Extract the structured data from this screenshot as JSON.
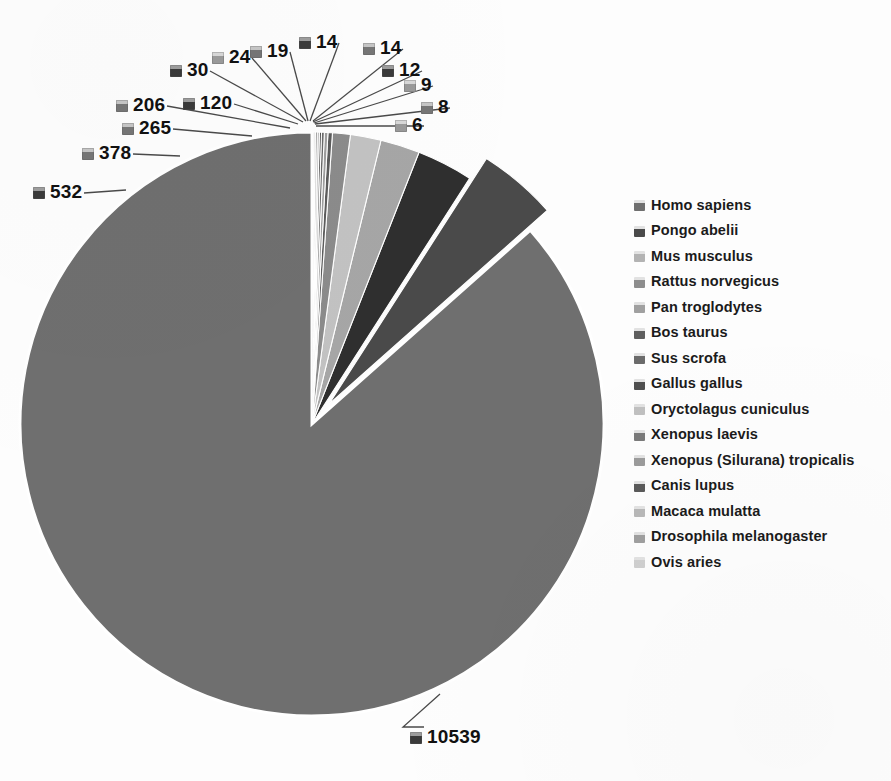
{
  "chart_data": {
    "type": "pie",
    "title": "",
    "subtitle": "",
    "xlabel": "",
    "ylabel": "",
    "legend_position": "right",
    "grid": false,
    "exploded_slices": [
      "Pongo abelii"
    ],
    "total": 12176,
    "categories": [
      "Homo sapiens",
      "Pongo abelii",
      "Mus musculus",
      "Rattus norvegicus",
      "Pan troglodytes",
      "Bos taurus",
      "Sus scrofa",
      "Gallus gallus",
      "Oryctolagus cuniculus",
      "Xenopus laevis",
      "Xenopus (Silurana) tropicalis",
      "Canis lupus",
      "Macaca mulatta",
      "Drosophila melanogaster",
      "Ovis aries"
    ],
    "values": [
      10539,
      532,
      378,
      265,
      206,
      120,
      30,
      24,
      19,
      14,
      14,
      12,
      9,
      8,
      6
    ],
    "slice_colors": [
      "#6f6f6f",
      "#4a4a4a",
      "#2f2f2f",
      "#a6a6a6",
      "#c2c2c2",
      "#8b8b8b",
      "#5c5c5c",
      "#9e9e9e",
      "#6a6a6a",
      "#3f3f3f",
      "#b0b0b0",
      "#7d7d7d",
      "#545454",
      "#949494",
      "#666666"
    ]
  },
  "labels": [
    {
      "value": "10539",
      "tone": "dark"
    },
    {
      "value": "532",
      "tone": "dark"
    },
    {
      "value": "378",
      "tone": "mid"
    },
    {
      "value": "265",
      "tone": "mid"
    },
    {
      "value": "206",
      "tone": "mid"
    },
    {
      "value": "120",
      "tone": "dark"
    },
    {
      "value": "30",
      "tone": "dark"
    },
    {
      "value": "24",
      "tone": "light"
    },
    {
      "value": "19",
      "tone": "mid"
    },
    {
      "value": "14",
      "tone": "dark"
    },
    {
      "value": "14",
      "tone": "mid"
    },
    {
      "value": "12",
      "tone": "dark"
    },
    {
      "value": "9",
      "tone": "light"
    },
    {
      "value": "8",
      "tone": "mid"
    },
    {
      "value": "6",
      "tone": "light"
    }
  ],
  "legend": {
    "items": [
      {
        "label": "Homo sapiens",
        "color": "#6f6f6f"
      },
      {
        "label": "Pongo abelii",
        "color": "#4a4a4a"
      },
      {
        "label": "Mus musculus",
        "color": "#b3b3b3"
      },
      {
        "label": "Rattus norvegicus",
        "color": "#8d8d8d"
      },
      {
        "label": "Pan troglodytes",
        "color": "#a0a0a0"
      },
      {
        "label": "Bos taurus",
        "color": "#5f5f5f"
      },
      {
        "label": "Sus scrofa",
        "color": "#6b6b6b"
      },
      {
        "label": "Gallus gallus",
        "color": "#4f4f4f"
      },
      {
        "label": "Oryctolagus cuniculus",
        "color": "#c0c0c0"
      },
      {
        "label": "Xenopus laevis",
        "color": "#7a7a7a"
      },
      {
        "label": "Xenopus (Silurana) tropicalis",
        "color": "#9b9b9b"
      },
      {
        "label": "Canis lupus",
        "color": "#5a5a5a"
      },
      {
        "label": "Macaca mulatta",
        "color": "#b8b8b8"
      },
      {
        "label": "Drosophila melanogaster",
        "color": "#9f9f9f"
      },
      {
        "label": "Ovis aries",
        "color": "#cfcfcf"
      }
    ]
  }
}
